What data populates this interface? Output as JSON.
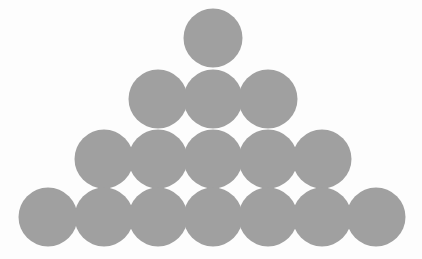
{
  "figure": {
    "background_color": "#fdfdfd",
    "width": 422,
    "height": 259
  },
  "chart_data": {
    "type": "scatter",
    "title": "",
    "subtitle": "",
    "xlabel": "",
    "ylabel": "",
    "xlim": [
      0,
      422
    ],
    "ylim": [
      0,
      259
    ],
    "grid": false,
    "legend": null,
    "tick_labels": {
      "x": [],
      "y": []
    },
    "annotations": [],
    "marker": {
      "shape": "circle",
      "diameter": 59,
      "radius": 29.5,
      "fill": "#a0a0a0",
      "stroke": "none"
    },
    "layout": {
      "rows": 4,
      "counts_per_row": [
        1,
        3,
        5,
        7
      ],
      "total_circles": 16,
      "horizontal_spacing": 54.7,
      "vertical_spacing": 59.7,
      "row_centers_y": [
        38,
        99,
        159,
        217
      ]
    },
    "series": [
      {
        "name": "row-1",
        "count": 1,
        "cy": 38,
        "x": [
          213
        ],
        "points": [
          {
            "cx": 213,
            "cy": 38,
            "r": 29.5
          }
        ]
      },
      {
        "name": "row-2",
        "count": 3,
        "cy": 99,
        "x": [
          158,
          213,
          268
        ],
        "points": [
          {
            "cx": 158,
            "cy": 99,
            "r": 29.5
          },
          {
            "cx": 213,
            "cy": 99,
            "r": 29.5
          },
          {
            "cx": 268,
            "cy": 99,
            "r": 29.5
          }
        ]
      },
      {
        "name": "row-3",
        "count": 5,
        "cy": 159,
        "x": [
          104,
          158,
          213,
          268,
          322
        ],
        "points": [
          {
            "cx": 104,
            "cy": 159,
            "r": 29.5
          },
          {
            "cx": 158,
            "cy": 159,
            "r": 29.5
          },
          {
            "cx": 213,
            "cy": 159,
            "r": 29.5
          },
          {
            "cx": 268,
            "cy": 159,
            "r": 29.5
          },
          {
            "cx": 322,
            "cy": 159,
            "r": 29.5
          }
        ]
      },
      {
        "name": "row-4",
        "count": 7,
        "cy": 217,
        "x": [
          48,
          104,
          158,
          213,
          268,
          322,
          376
        ],
        "points": [
          {
            "cx": 48,
            "cy": 217,
            "r": 29.5
          },
          {
            "cx": 104,
            "cy": 217,
            "r": 29.5
          },
          {
            "cx": 158,
            "cy": 217,
            "r": 29.5
          },
          {
            "cx": 213,
            "cy": 217,
            "r": 29.5
          },
          {
            "cx": 268,
            "cy": 217,
            "r": 29.5
          },
          {
            "cx": 322,
            "cy": 217,
            "r": 29.5
          },
          {
            "cx": 376,
            "cy": 217,
            "r": 29.5
          }
        ]
      }
    ]
  }
}
